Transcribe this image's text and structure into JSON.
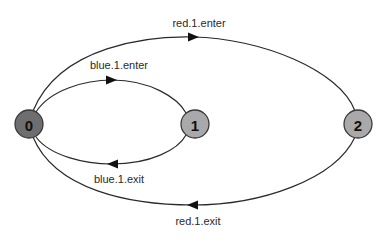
{
  "diagram": {
    "type": "state-transition",
    "nodes": [
      {
        "id": "0",
        "label": "0",
        "fill": "#6e6e6e",
        "cx": 29,
        "cy": 124,
        "r": 14
      },
      {
        "id": "1",
        "label": "1",
        "fill": "#a9a9a9",
        "cx": 195,
        "cy": 124,
        "r": 14
      },
      {
        "id": "2",
        "label": "2",
        "fill": "#a9a9a9",
        "cx": 358,
        "cy": 124,
        "r": 14
      }
    ],
    "edges": [
      {
        "id": "red-enter",
        "from": "0",
        "to": "2",
        "label": "red.1.enter"
      },
      {
        "id": "blue-enter",
        "from": "0",
        "to": "1",
        "label": "blue.1.enter"
      },
      {
        "id": "blue-exit",
        "from": "1",
        "to": "0",
        "label": "blue.1.exit"
      },
      {
        "id": "red-exit",
        "from": "2",
        "to": "0",
        "label": "red.1.exit"
      }
    ]
  }
}
